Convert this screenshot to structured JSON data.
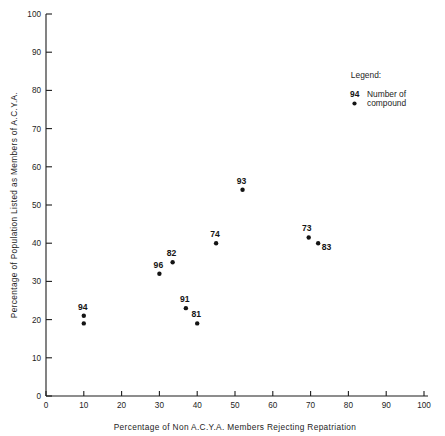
{
  "chart_data": {
    "type": "scatter",
    "title": "",
    "xlabel": "Percentage of Non A.C.Y.A. Members Rejecting Repatriation",
    "ylabel": "Percentage of Population Listed as Members of A.C.Y.A.",
    "xlim": [
      0,
      100
    ],
    "ylim": [
      0,
      100
    ],
    "xticks": [
      "0",
      "10",
      "20",
      "30",
      "40",
      "50",
      "60",
      "70",
      "80",
      "90",
      "100"
    ],
    "yticks": [
      "0",
      "10",
      "20",
      "30",
      "40",
      "50",
      "60",
      "70",
      "80",
      "90",
      "100"
    ],
    "xtick_values": [
      0,
      10,
      20,
      30,
      40,
      50,
      60,
      70,
      80,
      90,
      100
    ],
    "ytick_values": [
      0,
      10,
      20,
      30,
      40,
      50,
      60,
      70,
      80,
      90,
      100
    ],
    "grid": false,
    "point_color": "#141414",
    "axis_color": "#1d1d1d",
    "points": [
      {
        "label": "94",
        "x": 10,
        "y": 21,
        "label_dx": -1,
        "label_dy": -6
      },
      {
        "label": "",
        "x": 10,
        "y": 19,
        "label_dx": 0,
        "label_dy": 0
      },
      {
        "label": "96",
        "x": 30,
        "y": 32,
        "label_dx": -1,
        "label_dy": -6
      },
      {
        "label": "82",
        "x": 33.5,
        "y": 35,
        "label_dx": -1,
        "label_dy": -6
      },
      {
        "label": "91",
        "x": 37,
        "y": 23,
        "label_dx": -1,
        "label_dy": -6
      },
      {
        "label": "81",
        "x": 40,
        "y": 19,
        "label_dx": -1,
        "label_dy": -6
      },
      {
        "label": "74",
        "x": 45,
        "y": 40,
        "label_dx": -1,
        "label_dy": -6
      },
      {
        "label": "93",
        "x": 52,
        "y": 54,
        "label_dx": -1,
        "label_dy": -6
      },
      {
        "label": "73",
        "x": 69.5,
        "y": 41.5,
        "label_dx": -2,
        "label_dy": -6
      },
      {
        "label": "83",
        "x": 72,
        "y": 40,
        "label_dx": 3.5,
        "label_dy": 7
      }
    ],
    "legend": {
      "position": "top-right",
      "title": "Legend:",
      "sample_number": "94",
      "line1": "Number of",
      "line2": "compound"
    }
  }
}
